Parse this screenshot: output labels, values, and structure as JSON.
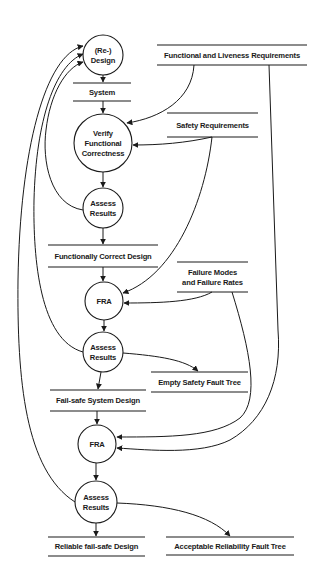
{
  "diagram": {
    "type": "data-flow",
    "processes": [
      {
        "id": "redesign",
        "lines": [
          "(Re-)",
          "Design"
        ],
        "cx": 103,
        "cy": 55,
        "r": 20
      },
      {
        "id": "verify",
        "lines": [
          "Verify",
          "Functional",
          "Correctness"
        ],
        "cx": 103,
        "cy": 143,
        "r": 29
      },
      {
        "id": "assess1",
        "lines": [
          "Assess",
          "Results"
        ],
        "cx": 103,
        "cy": 208,
        "r": 20
      },
      {
        "id": "fra1",
        "lines": [
          "FRA"
        ],
        "cx": 104,
        "cy": 301,
        "r": 19
      },
      {
        "id": "assess2",
        "lines": [
          "Assess",
          "Results"
        ],
        "cx": 103,
        "cy": 352,
        "r": 20
      },
      {
        "id": "fra2",
        "lines": [
          "FRA"
        ],
        "cx": 97,
        "cy": 444,
        "r": 19
      },
      {
        "id": "assess3",
        "lines": [
          "Assess",
          "Results"
        ],
        "cx": 96,
        "cy": 502,
        "r": 21
      }
    ],
    "stores": [
      {
        "id": "system",
        "lines": [
          "System"
        ],
        "x1": 73,
        "x2": 131,
        "y1": 83,
        "y2": 101
      },
      {
        "id": "func_live_req",
        "lines": [
          "Functional and Liveness Requirements"
        ],
        "x1": 157,
        "x2": 307,
        "y1": 45,
        "y2": 65
      },
      {
        "id": "safety_req",
        "lines": [
          "Safety Requirements"
        ],
        "x1": 167,
        "x2": 258,
        "y1": 113,
        "y2": 137
      },
      {
        "id": "func_correct",
        "lines": [
          "Functionally Correct Design"
        ],
        "x1": 48,
        "x2": 158,
        "y1": 245,
        "y2": 267
      },
      {
        "id": "failure_modes",
        "lines": [
          "Failure Modes",
          "and Failure Rates"
        ],
        "x1": 177,
        "x2": 248,
        "y1": 262,
        "y2": 292
      },
      {
        "id": "empty_safety_ft",
        "lines": [
          "Empty Safety Fault Tree"
        ],
        "x1": 151,
        "x2": 248,
        "y1": 372,
        "y2": 392
      },
      {
        "id": "failsafe_design",
        "lines": [
          "Fail-safe System Design"
        ],
        "x1": 50,
        "x2": 146,
        "y1": 390,
        "y2": 411
      },
      {
        "id": "reliable_design",
        "lines": [
          "Reliable fail-safe Design"
        ],
        "x1": 48,
        "x2": 145,
        "y1": 537,
        "y2": 556
      },
      {
        "id": "acceptable_ft",
        "lines": [
          "Acceptable Reliability Fault Tree"
        ],
        "x1": 166,
        "x2": 294,
        "y1": 537,
        "y2": 555
      }
    ],
    "flows": [
      {
        "from": "redesign",
        "to": "system",
        "d": "M103,75 L103,82"
      },
      {
        "from": "system",
        "to": "verify",
        "d": "M103,101 L103,113"
      },
      {
        "from": "verify",
        "to": "assess1",
        "d": "M103,172 L103,187"
      },
      {
        "from": "assess1",
        "to": "func_correct",
        "d": "M103,228 L103,244"
      },
      {
        "from": "func_correct",
        "to": "fra1",
        "d": "M103,267 L103,281"
      },
      {
        "from": "fra1",
        "to": "assess2",
        "d": "M104,320 L104,331"
      },
      {
        "from": "assess2",
        "to": "failsafe_design",
        "d": "M101,372 L98,389"
      },
      {
        "from": "failsafe_design",
        "to": "fra2",
        "d": "M97,411 L97,424"
      },
      {
        "from": "fra2",
        "to": "assess3",
        "d": "M96,463 L96,480"
      },
      {
        "from": "assess3",
        "to": "reliable_design",
        "d": "M96,523 L96,536"
      },
      {
        "from": "assess2",
        "to": "empty_safety_ft",
        "d": "M123,353 C160,356 185,360 198,371"
      },
      {
        "from": "assess3",
        "to": "acceptable_ft",
        "d": "M117,503 C170,505 210,515 230,536"
      },
      {
        "from": "func_live_req",
        "to": "verify",
        "d": "M194,65 C192,100 160,118 127,123"
      },
      {
        "from": "safety_req",
        "to": "verify",
        "d": "M212,137 C185,143 160,145 133,145"
      },
      {
        "from": "safety_req",
        "to": "fra1",
        "d": "M212,137 C205,200 175,275 123,293"
      },
      {
        "from": "failure_modes",
        "to": "fra1",
        "d": "M212,292 C195,302 160,303 124,303"
      },
      {
        "from": "failure_modes",
        "to": "fra2",
        "d": "M232,292 C250,350 260,400 240,418 C215,437 170,437 117,437"
      },
      {
        "from": "func_live_req",
        "to": "fra2",
        "d": "M269,65 L278,330 C282,380 265,420 230,440 C200,455 150,450 117,448"
      },
      {
        "from": "assess1",
        "to": "redesign",
        "d": "M83,210 C50,205 42,160 46,130 C50,95 65,68 83,62"
      },
      {
        "from": "assess2",
        "to": "redesign",
        "d": "M83,352 C40,340 33,260 34,200 C36,120 55,65 83,54"
      },
      {
        "from": "assess3",
        "to": "redesign",
        "d": "M75,502 C25,470 17,380 18,280 C20,150 45,55 83,46"
      }
    ]
  }
}
